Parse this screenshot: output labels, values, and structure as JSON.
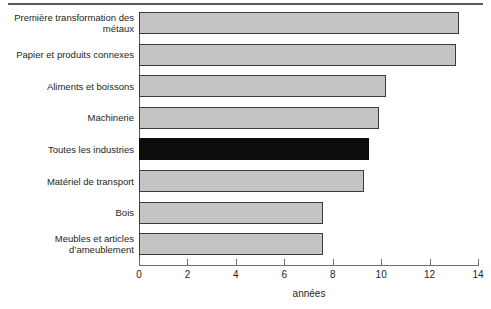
{
  "figure": {
    "axis_title": "années",
    "bar_fill_color": "#c4c4c4",
    "bar_border_color": "#3b3b3b",
    "highlight_color": "#0d0d0d",
    "rule_color": "#58595b"
  },
  "chart_data": {
    "type": "bar",
    "orientation": "horizontal",
    "title": "",
    "subtitle": "",
    "xlabel": "années",
    "ylabel": "",
    "xlim": [
      0,
      14
    ],
    "xticks": [
      0,
      2,
      4,
      6,
      8,
      10,
      12,
      14
    ],
    "xtick_labels": [
      "0",
      "2",
      "4",
      "6",
      "8",
      "10",
      "12",
      "14"
    ],
    "grid": false,
    "legend": null,
    "categories": [
      "Première transformation des métaux",
      "Papier et produits connexes",
      "Aliments et boissons",
      "Machinerie",
      "Toutes les industries",
      "Matériel de transport",
      "Bois",
      "Meubles et articles d’ameublement"
    ],
    "category_lines": [
      [
        "Première transformation des",
        "métaux"
      ],
      [
        "Papier et produits connexes"
      ],
      [
        "Aliments et boissons"
      ],
      [
        "Machinerie"
      ],
      [
        "Toutes les industries"
      ],
      [
        "Matériel de transport"
      ],
      [
        "Bois"
      ],
      [
        "Meubles et articles",
        "d’ameublement"
      ]
    ],
    "values": [
      13.2,
      13.1,
      10.2,
      9.9,
      9.5,
      9.3,
      7.6,
      7.6
    ],
    "highlight_index": 4,
    "highlight_label": "Toutes les industries"
  }
}
